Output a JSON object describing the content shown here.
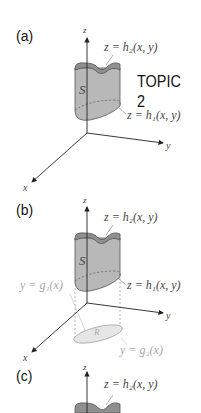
{
  "panels": [
    {
      "label": "(a)",
      "axes": {
        "z": "z",
        "y": "y",
        "x": "x"
      },
      "surface_top": "z = h₂(x, y)",
      "surface_bottom": "z = h₁(x, y)",
      "solid_label": "S"
    },
    {
      "label": "(b)",
      "axes": {
        "z": "z",
        "y": "y",
        "x": "x"
      },
      "surface_top": "z = h₂(x, y)",
      "surface_bottom": "z = h₁(x, y)",
      "solid_label": "S",
      "left_curve": "y = g₁(x)",
      "right_curve": "y = g₂(x)",
      "region_label": "R"
    },
    {
      "label": "(c)",
      "axes": {
        "z": "z"
      },
      "surface_top": "z = h₂(x, y)"
    }
  ],
  "topic_label": "TOPIC 2",
  "colors": {
    "solid_fill": "#b5b5b5",
    "solid_top": "#8f8f8f",
    "region_fill": "#e6e6e6",
    "axis": "#222222",
    "faint_text": "#a8a8a8"
  }
}
